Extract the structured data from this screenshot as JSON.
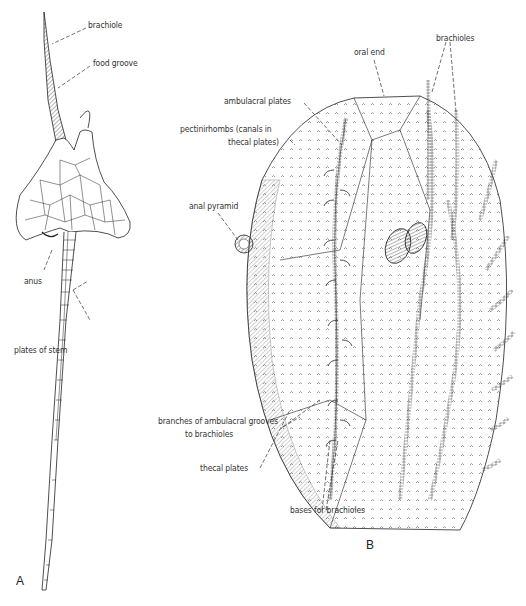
{
  "figure": {
    "panels": [
      {
        "id": "A",
        "letter": "A",
        "labels": {
          "brachiole": "brachiole",
          "food_groove": "food groove",
          "anus": "anus",
          "plates_of_stem": "plates of stem"
        }
      },
      {
        "id": "B",
        "letter": "B",
        "labels": {
          "oral_end": "oral end",
          "brachioles": "brachioles",
          "ambulacral_plates": "ambulacral plates",
          "pectinirhombs_1": "pectinirhombs (canals in",
          "pectinirhombs_2": "thecal plates)",
          "anal_pyramid": "anal pyramid",
          "branches_1": "branches of ambulacral grooves",
          "branches_2": "to brachioles",
          "thecal_plates": "thecal plates",
          "bases_for_brachioles": "bases for brachioles"
        }
      }
    ]
  }
}
